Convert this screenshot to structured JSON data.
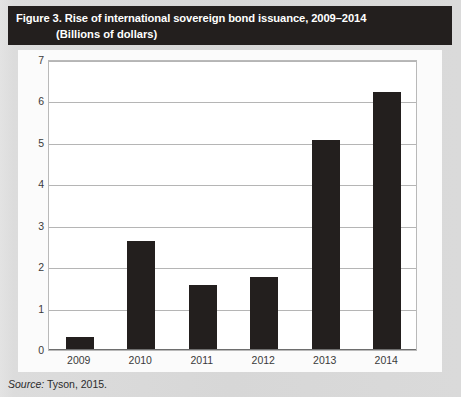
{
  "figure": {
    "title_line1": "Figure 3. Rise of international sovereign bond issuance, 2009–2014",
    "title_line2": "(Billions of dollars)",
    "source_label": "Source:",
    "source_text": " Tyson, 2015."
  },
  "colors": {
    "title_bar_bg": "#231f1e",
    "title_bar_text": "#ffffff",
    "bar_fill": "#231f1e",
    "page_bg": "#d9d9d9",
    "panel_bg": "#fbfbfb",
    "gridline": "#b5b5b5"
  },
  "chart_data": {
    "type": "bar",
    "title": "Figure 3. Rise of international sovereign bond issuance, 2009–2014",
    "subtitle": "(Billions of dollars)",
    "xlabel": "",
    "ylabel": "",
    "categories": [
      "2009",
      "2010",
      "2011",
      "2012",
      "2013",
      "2014"
    ],
    "values": [
      0.28,
      2.6,
      1.55,
      1.75,
      5.05,
      6.2
    ],
    "ylim": [
      0,
      7
    ],
    "yticks": [
      0,
      1,
      2,
      3,
      4,
      5,
      6,
      7
    ],
    "ytick_labels": [
      "0",
      "1",
      "2",
      "3",
      "4",
      "5",
      "6",
      "7"
    ],
    "grid": true,
    "legend": false,
    "series_color": "#231f1e"
  }
}
